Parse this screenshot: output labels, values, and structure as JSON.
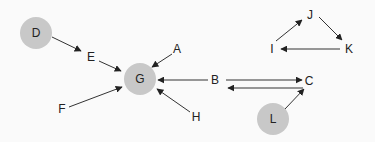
{
  "diagram": {
    "type": "directed-graph",
    "colors": {
      "background": "#fafafa",
      "node_fill": "#c8c8c8",
      "edge": "#333333",
      "text": "#222222"
    },
    "nodes": [
      {
        "id": "D",
        "label": "D",
        "x": 36,
        "y": 33,
        "circle": true
      },
      {
        "id": "E",
        "label": "E",
        "x": 91,
        "y": 57,
        "circle": false
      },
      {
        "id": "G",
        "label": "G",
        "x": 140,
        "y": 79,
        "circle": true
      },
      {
        "id": "A",
        "label": "A",
        "x": 177,
        "y": 49,
        "circle": false
      },
      {
        "id": "B",
        "label": "B",
        "x": 215,
        "y": 80,
        "circle": false
      },
      {
        "id": "C",
        "label": "C",
        "x": 309,
        "y": 81,
        "circle": false
      },
      {
        "id": "F",
        "label": "F",
        "x": 62,
        "y": 109,
        "circle": false
      },
      {
        "id": "H",
        "label": "H",
        "x": 196,
        "y": 117,
        "circle": false
      },
      {
        "id": "L",
        "label": "L",
        "x": 273,
        "y": 119,
        "circle": true
      },
      {
        "id": "I",
        "label": "I",
        "x": 272,
        "y": 49,
        "circle": false
      },
      {
        "id": "J",
        "label": "J",
        "x": 310,
        "y": 15,
        "circle": false
      },
      {
        "id": "K",
        "label": "K",
        "x": 349,
        "y": 49,
        "circle": false
      }
    ],
    "edges": [
      {
        "from": "D",
        "to": "E"
      },
      {
        "from": "E",
        "to": "G"
      },
      {
        "from": "A",
        "to": "G"
      },
      {
        "from": "B",
        "to": "G"
      },
      {
        "from": "F",
        "to": "G"
      },
      {
        "from": "H",
        "to": "G"
      },
      {
        "from": "B",
        "to": "C"
      },
      {
        "from": "C",
        "to": "B"
      },
      {
        "from": "L",
        "to": "C"
      },
      {
        "from": "I",
        "to": "J"
      },
      {
        "from": "J",
        "to": "K"
      },
      {
        "from": "K",
        "to": "I"
      }
    ]
  }
}
